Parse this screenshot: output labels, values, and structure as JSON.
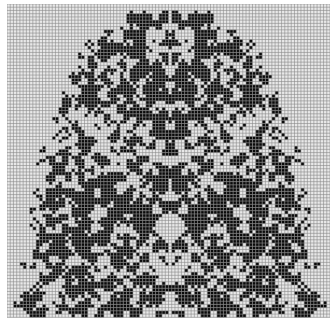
{
  "figure": {
    "background_color": "#ffffff",
    "cell_empty_color": "#e8e8e8",
    "cell_filled_color": "#0a0a0a",
    "gridline_color": "#8a8a8a"
  },
  "grid": {
    "origin_x": 7,
    "origin_y": 4,
    "cols": 100,
    "rows": 97,
    "cell_size": 3.23,
    "symmetry_axis_col": 50,
    "dome": {
      "apex_row": 2,
      "base_row": 96,
      "shoulder_row": 40,
      "half_width_top": 12,
      "half_width_shoulder": 40,
      "half_width_base": 49
    },
    "fill_density": 0.46,
    "seed": 1337
  }
}
